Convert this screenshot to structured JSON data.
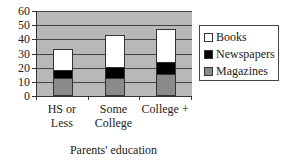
{
  "chart_data": {
    "type": "bar",
    "stacked": true,
    "title": "",
    "xlabel": "Parents' education",
    "ylabel": "",
    "ylim": [
      0,
      60
    ],
    "yticks": [
      0,
      10,
      20,
      30,
      40,
      50,
      60
    ],
    "grid": true,
    "legend_position": "right",
    "categories": [
      "HS or Less",
      "Some College",
      "College +"
    ],
    "category_lines": [
      [
        "HS or",
        "Less"
      ],
      [
        "Some",
        "College"
      ],
      [
        "College +"
      ]
    ],
    "series": [
      {
        "name": "Magazines",
        "color": "#8a8a8a",
        "values": [
          12,
          12,
          15
        ]
      },
      {
        "name": "Newspapers",
        "color": "#000000",
        "values": [
          6,
          8,
          8
        ]
      },
      {
        "name": "Books",
        "color": "#ffffff",
        "values": [
          15,
          23,
          24
        ]
      }
    ],
    "legend": [
      "Books",
      "Newspapers",
      "Magazines"
    ]
  },
  "colors": {
    "plot_background": "#b8b8b8",
    "gridline": "#444444"
  }
}
